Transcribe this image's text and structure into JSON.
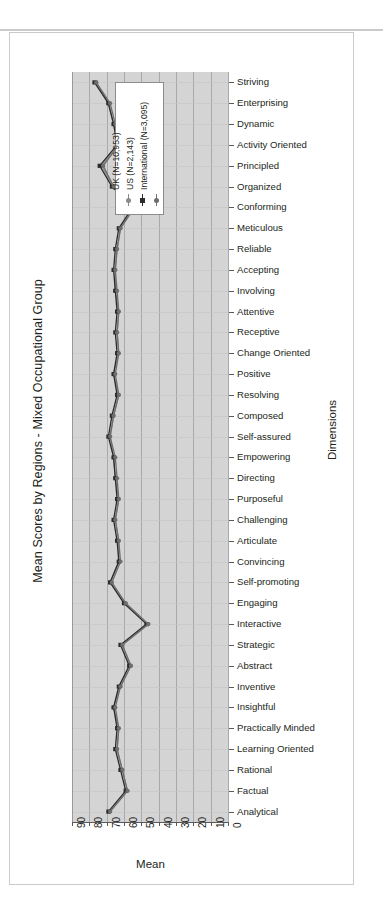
{
  "chart_data": {
    "type": "line",
    "orientation": "horizontal",
    "title": "Mean Scores by Regions - Mixed Occupational Group",
    "xlabel": "Mean",
    "ylabel": "Dimensions",
    "xlim": [
      0,
      90
    ],
    "x_reversed": true,
    "x_ticks": [
      "90",
      "80",
      "70",
      "60",
      "50",
      "40",
      "30",
      "20",
      "10",
      "0"
    ],
    "grid": "vertical",
    "legend_position": "top-inside",
    "categories": [
      "Striving",
      "Enterprising",
      "Dynamic",
      "Activity Oriented",
      "Principled",
      "Organized",
      "Conforming",
      "Meticulous",
      "Reliable",
      "Accepting",
      "Involving",
      "Attentive",
      "Receptive",
      "Change Oriented",
      "Positive",
      "Resolving",
      "Composed",
      "Self-assured",
      "Empowering",
      "Directing",
      "Purposeful",
      "Challenging",
      "Articulate",
      "Convincing",
      "Self-promoting",
      "Engaging",
      "Interactive",
      "Strategic",
      "Abstract",
      "Inventive",
      "Insightful",
      "Practically Minded",
      "Learning Oriented",
      "Rational",
      "Factual",
      "Analytical"
    ],
    "series": [
      {
        "name": "UK (N=10,953)",
        "color": "#8a8a8a",
        "marker": "dot",
        "values": [
          76,
          69,
          66,
          63,
          73,
          66,
          54,
          62,
          64,
          65,
          65,
          63,
          64,
          63,
          66,
          63,
          66,
          68,
          66,
          65,
          63,
          65,
          63,
          63,
          68,
          59,
          46,
          61,
          56,
          62,
          66,
          63,
          64,
          61,
          58,
          68
        ]
      },
      {
        "name": "US (N=2,143)",
        "color": "#2b2b2b",
        "marker": "square",
        "values": [
          77,
          69,
          66,
          64,
          74,
          67,
          55,
          63,
          65,
          66,
          65,
          64,
          65,
          64,
          66,
          64,
          67,
          69,
          66,
          65,
          64,
          66,
          64,
          63,
          68,
          60,
          47,
          62,
          57,
          63,
          66,
          64,
          65,
          62,
          59,
          69
        ]
      },
      {
        "name": "International (N=3,095)",
        "color": "#6e6e6e",
        "marker": "dot",
        "values": [
          76,
          68,
          65,
          63,
          72,
          66,
          54,
          62,
          64,
          65,
          64,
          63,
          64,
          63,
          65,
          63,
          66,
          68,
          65,
          64,
          63,
          65,
          63,
          62,
          67,
          59,
          46,
          61,
          56,
          62,
          65,
          63,
          64,
          61,
          58,
          68
        ]
      }
    ]
  },
  "legend": {
    "entries": [
      {
        "label": "UK (N=10,953)",
        "color": "#8a8a8a",
        "marker": "dot"
      },
      {
        "label": "US (N=2,143)",
        "color": "#2b2b2b",
        "marker": "square"
      },
      {
        "label": "International (N=3,095)",
        "color": "#6e6e6e",
        "marker": "dot"
      }
    ]
  }
}
